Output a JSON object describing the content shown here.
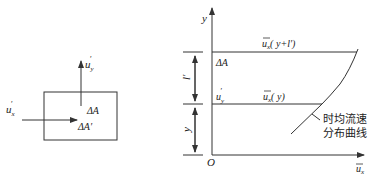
{
  "left_figure": {
    "velocity_x_label": "u",
    "velocity_x_sub": "x",
    "velocity_y_label": "u",
    "velocity_y_sub": "y",
    "prime": "′",
    "area_label": "ΔA",
    "area_prime_label": "ΔA′"
  },
  "right_figure": {
    "y_axis_label": "y",
    "x_axis_label": "u",
    "x_axis_sub": "x",
    "origin_label": "O",
    "top_line_label_u": "u",
    "top_line_label_sub": "x",
    "top_line_label_arg": "( y+l′)",
    "mid_line_label_u": "u",
    "mid_line_label_sub": "x",
    "mid_line_label_arg": "( y)",
    "area_label": "ΔA",
    "uy_label": "u",
    "uy_sub": "y",
    "prime": "′",
    "dim_upper_label": "l′",
    "dim_lower_label": "y",
    "curve_caption_line1": "时均流速",
    "curve_caption_line2": "分布曲线"
  }
}
